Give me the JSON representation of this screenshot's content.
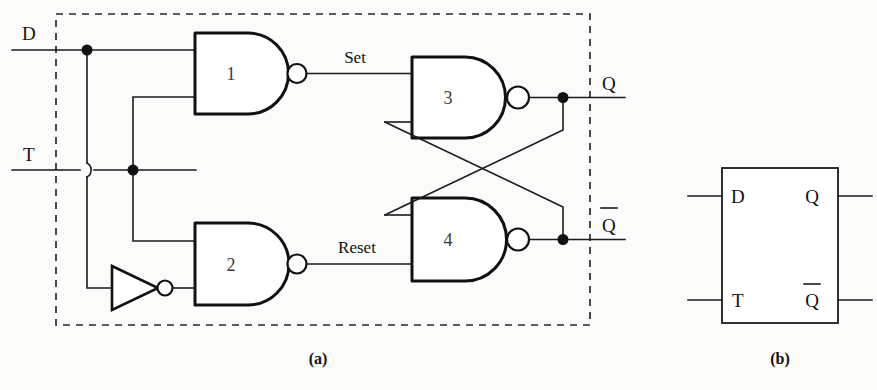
{
  "figure": {
    "captions": {
      "a": "(a)",
      "b": "(b)"
    },
    "colors": {
      "ink": "#111111",
      "wire": "#1b1b1b",
      "paper": "#fbfbfa",
      "dashed_border": "#2b2b2b"
    }
  },
  "circuit": {
    "inputs": [
      {
        "name": "input-d",
        "label": "D"
      },
      {
        "name": "input-t",
        "label": "T"
      }
    ],
    "outputs": [
      {
        "name": "output-q",
        "label": "Q"
      },
      {
        "name": "output-qbar",
        "label": "Q",
        "overbar": true
      }
    ],
    "gates": [
      {
        "name": "nand-gate-1",
        "label": "1",
        "type": "nand"
      },
      {
        "name": "nand-gate-2",
        "label": "2",
        "type": "nand"
      },
      {
        "name": "nand-gate-3",
        "label": "3",
        "type": "nand"
      },
      {
        "name": "nand-gate-4",
        "label": "4",
        "type": "nand"
      }
    ],
    "inverter": {
      "name": "inverter-gate",
      "type": "not"
    },
    "internal_signals": [
      {
        "name": "signal-set",
        "label": "Set"
      },
      {
        "name": "signal-reset",
        "label": "Reset"
      }
    ],
    "enclosure": {
      "name": "dashed-boundary",
      "style": "dashed"
    }
  },
  "symbol": {
    "name": "latch-block-symbol",
    "pins_left": [
      {
        "name": "pin-d",
        "label": "D"
      },
      {
        "name": "pin-t",
        "label": "T"
      }
    ],
    "pins_right": [
      {
        "name": "pin-q",
        "label": "Q",
        "overbar": false
      },
      {
        "name": "pin-qbar",
        "label": "Q",
        "overbar": true
      }
    ]
  }
}
